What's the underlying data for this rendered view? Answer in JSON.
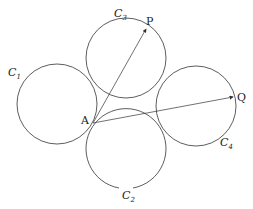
{
  "diagram": {
    "circles": [
      {
        "id": "C1",
        "label": "C",
        "sub": "1"
      },
      {
        "id": "C2",
        "label": "C",
        "sub": "2"
      },
      {
        "id": "C3",
        "label": "C",
        "sub": "3"
      },
      {
        "id": "C4",
        "label": "C",
        "sub": "4"
      }
    ],
    "points": {
      "A": "A",
      "P": "P",
      "Q": "Q"
    },
    "vectors": [
      "AP",
      "AQ"
    ],
    "stroke_color": "#333333"
  }
}
